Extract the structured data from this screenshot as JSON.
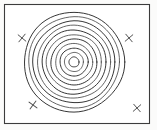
{
  "figure": {
    "kind": "concentric-circles-target-diagram",
    "canvas": {
      "width": 157,
      "height": 130
    },
    "background_color": "#ffffff"
  },
  "frame": {
    "name": "outer-border",
    "x": 4.5,
    "y": 4.5,
    "width": 145,
    "height": 119,
    "stroke_color": "#3c3c3c",
    "fill_color": "#ffffff"
  },
  "target": {
    "label": "concentric-rings",
    "center_x": 74,
    "center_y": 62,
    "ring_count": 11,
    "stroke_color": "#2b2b2b",
    "outer_radius": 50,
    "radii": [
      50,
      45.5,
      41,
      36.5,
      32,
      27.5,
      23,
      18.5,
      14,
      9.5,
      5
    ],
    "ring_wobble": [
      0.9,
      0.8,
      0.7,
      0.6,
      0.5,
      0.45,
      0.4,
      0.35,
      0.3,
      0.25,
      0.2
    ]
  },
  "markers": {
    "glyph": "X",
    "stroke_color": "#4f4f4f",
    "size": 7,
    "items": [
      {
        "id": "marker-top-left",
        "label": "X",
        "x": 22,
        "y": 38,
        "rotation": -6
      },
      {
        "id": "marker-top-right",
        "label": "X",
        "x": 129,
        "y": 38,
        "rotation": 5
      },
      {
        "id": "marker-bottom-left",
        "label": "X",
        "x": 33,
        "y": 105,
        "rotation": -8
      },
      {
        "id": "marker-bottom-right",
        "label": "X",
        "x": 137,
        "y": 108,
        "rotation": 4
      }
    ]
  }
}
